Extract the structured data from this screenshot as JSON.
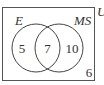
{
  "diagram": {
    "type": "venn",
    "universe_label": "U",
    "sets": [
      {
        "label": "E"
      },
      {
        "label": "MS"
      }
    ],
    "regions": {
      "only_E": "5",
      "intersection": "7",
      "only_MS": "10",
      "outside": "6"
    },
    "colors": {
      "stroke": "#444444",
      "background": "#ffffff"
    }
  }
}
